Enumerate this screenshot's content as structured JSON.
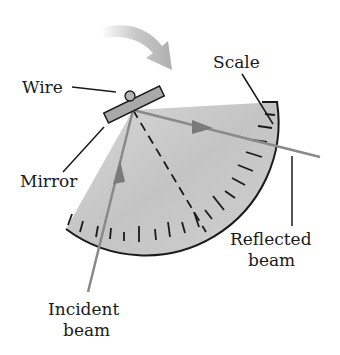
{
  "diagram": {
    "labels": {
      "wire": "Wire",
      "mirror": "Mirror",
      "scale": "Scale",
      "reflected_line1": "Reflected",
      "reflected_line2": "beam",
      "incident_line1": "Incident",
      "incident_line2": "beam"
    },
    "colors": {
      "fan_fill": "#c9c9c9",
      "mirror_fill": "#a9a9a9",
      "beam": "#8a8a8a",
      "ink": "#1a1a1a",
      "rotation_arrow": "#b5b5b5"
    },
    "elements": [
      "rotation-arrow",
      "wire",
      "mirror",
      "scale-fan",
      "incident-beam",
      "reflected-beam",
      "normal-dashed-line"
    ]
  }
}
